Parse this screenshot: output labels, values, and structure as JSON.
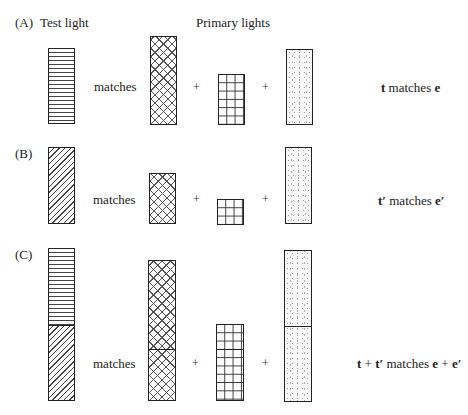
{
  "labels": {
    "panel_a": "(A)",
    "panel_b": "(B)",
    "panel_c": "(C)",
    "test_light": "Test light",
    "primary_lights": "Primary lights"
  },
  "operators": {
    "matches": "matches",
    "plus": "+"
  },
  "results": {
    "a": {
      "t": "t",
      "mid": " matches ",
      "e": "e"
    },
    "b": {
      "t": "t′",
      "mid": " matches ",
      "e": "e′"
    },
    "c": {
      "t1": "t",
      "p1": " + ",
      "t2": "t′",
      "mid": " matches ",
      "e1": "e",
      "p2": " + ",
      "e2": "e′"
    }
  },
  "patterns": {
    "test_t": "horizontal-stripes",
    "test_t_prime": "diagonal-hatch",
    "primary_1": "crosshatch",
    "primary_2": "square-grid",
    "primary_3": "stipple-dots"
  }
}
